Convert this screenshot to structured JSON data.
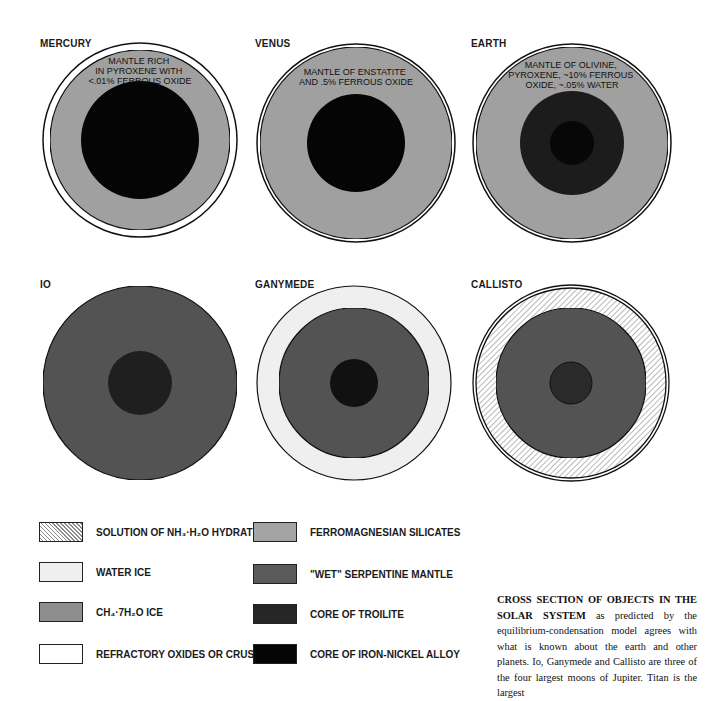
{
  "figure": {
    "bodies": [
      {
        "name": "MERCURY",
        "annotation": [
          "MANTLE RICH",
          "IN PYROXENE WITH",
          "<.01% FERROUS OXIDE"
        ],
        "layers": [
          "refractory oxides or crust",
          "ferromagnesian silicates",
          "core of iron-nickel alloy"
        ]
      },
      {
        "name": "VENUS",
        "annotation": [
          "MANTLE OF ENSTATITE",
          "AND .5% FERROUS OXIDE"
        ],
        "layers": [
          "refractory oxides or crust",
          "ferromagnesian silicates",
          "core of iron-nickel alloy"
        ]
      },
      {
        "name": "EARTH",
        "annotation": [
          "MANTLE OF OLIVINE,",
          "PYROXENE, ~10% FERROUS",
          "OXIDE, ~.05% WATER"
        ],
        "layers": [
          "refractory oxides or crust",
          "ferromagnesian silicates",
          "core of troilite",
          "core of iron-nickel alloy"
        ]
      },
      {
        "name": "IO",
        "annotation": [],
        "layers": [
          "\"wet\" serpentine mantle",
          "core of troilite"
        ]
      },
      {
        "name": "GANYMEDE",
        "annotation": [],
        "layers": [
          "water ice",
          "\"wet\" serpentine mantle",
          "core of troilite"
        ]
      },
      {
        "name": "CALLISTO",
        "annotation": [],
        "layers": [
          "water ice",
          "solution of NH3·H2O hydrate",
          "\"wet\" serpentine mantle",
          "core of troilite"
        ]
      }
    ],
    "legend": {
      "left": [
        {
          "label": "SOLUTION OF NH₃·H₂O HYDRATE",
          "pattern": "hatched"
        },
        {
          "label": "WATER ICE",
          "color": "#efefef"
        },
        {
          "label": "CH₄·7H₂O  ICE",
          "color": "#8e8e8e"
        },
        {
          "label": "REFRACTORY OXIDES OR CRUST",
          "color": "#ffffff"
        }
      ],
      "right": [
        {
          "label": "FERROMAGNESIAN  SILICATES",
          "color": "#a4a4a4"
        },
        {
          "label": "\"WET\" SERPENTINE MANTLE",
          "color": "#5a5a5a"
        },
        {
          "label": "CORE OF TROILITE",
          "color": "#262626"
        },
        {
          "label": "CORE OF IRON-NICKEL ALLOY",
          "color": "#050505"
        }
      ]
    },
    "caption": {
      "lead": "CROSS SECTION OF OBJECTS IN THE SOLAR SYSTEM",
      "text": " as predicted by the equilibrium-condensation model agrees with what is known about the earth and other planets. Io, Ganymede and Callisto are three of the four largest moons of Jupiter. Titan is the largest"
    },
    "colors": {
      "ferromagnesian": "#a4a4a4",
      "serpentine": "#555555",
      "troilite": "#262626",
      "iron_nickel": "#050505",
      "water_ice": "#efefef",
      "outline": "#111111"
    }
  }
}
